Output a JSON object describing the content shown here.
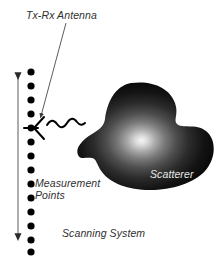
{
  "figure": {
    "type": "diagram",
    "title": "Scanning System",
    "background_color": "#ffffff",
    "width": 219,
    "height": 257
  },
  "labels": {
    "antenna": "Tx-Rx Antenna",
    "measurement_line1": "Measurement",
    "measurement_line2": "Points",
    "scanning_system": "Scanning System",
    "scatterer": "Scatterer"
  },
  "colors": {
    "text": "#303030",
    "scatterer_label": "#e8e8e8",
    "ink": "#000000",
    "leader": "#4a4a4a",
    "blob_core": "#f2f2f2",
    "blob_mid": "#5a5a5a",
    "blob_edge": "#080808"
  },
  "elements": {
    "measurement_points": {
      "name": "measurement-points-column",
      "count": 13,
      "x": 31,
      "y_start": 72,
      "spacing": 14,
      "radius": 3.6,
      "antenna_index": 4
    },
    "scan_axis_arrow": {
      "name": "scan-axis-double-arrow",
      "x": 18,
      "y_top": 72,
      "y_bottom": 241,
      "double_headed": true
    },
    "antenna_symbol": {
      "name": "dipole-antenna-symbol",
      "x": 31,
      "y": 128
    },
    "radiated_wave": {
      "name": "radiated-wave",
      "x_start": 46,
      "y": 124,
      "cycles": 2.5,
      "amplitude": 4
    },
    "leader_line": {
      "name": "antenna-leader-line",
      "from_x": 66,
      "from_y": 22,
      "to_x": 40,
      "to_y": 118
    },
    "scatterer_blob": {
      "name": "scatterer-blob",
      "center_x": 143,
      "center_y": 139,
      "highlight_x": 141,
      "highlight_y": 147
    }
  }
}
